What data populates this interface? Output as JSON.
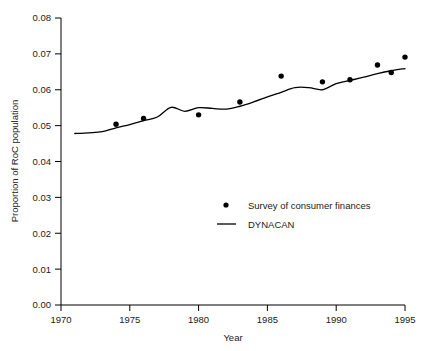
{
  "figure": {
    "clipped_header_text": "",
    "background_color": "#ffffff",
    "foreground_color": "#000000"
  },
  "axes": {
    "x_title": "Year",
    "y_title": "Proportion of RoC population",
    "x_tick_labels": [
      "1970",
      "1975",
      "1980",
      "1985",
      "1990",
      "1995"
    ],
    "y_tick_labels": [
      "0.00",
      "0.01",
      "0.02",
      "0.03",
      "0.04",
      "0.05",
      "0.06",
      "0.07",
      "0.08"
    ]
  },
  "legend": {
    "entries": [
      {
        "label": "Survey of consumer finances",
        "marker": "dot-marker",
        "color": "#000000"
      },
      {
        "label": "DYNACAN",
        "marker": "line-marker",
        "color": "#000000"
      }
    ]
  },
  "chart_data": {
    "type": "scatter",
    "title": "",
    "xlabel": "Year",
    "ylabel": "Proportion of RoC population",
    "xlim": [
      1970,
      1995
    ],
    "ylim": [
      0.0,
      0.08
    ],
    "xticks": [
      1970,
      1975,
      1980,
      1985,
      1990,
      1995
    ],
    "yticks": [
      0.0,
      0.01,
      0.02,
      0.03,
      0.04,
      0.05,
      0.06,
      0.07,
      0.08
    ],
    "grid": false,
    "legend_position": "center-right",
    "series": [
      {
        "name": "Survey of consumer finances",
        "type": "scatter",
        "marker": "circle",
        "color": "#000000",
        "x": [
          1974,
          1976,
          1980,
          1983,
          1986,
          1989,
          1991,
          1993,
          1994,
          1995
        ],
        "values": [
          0.0504,
          0.052,
          0.053,
          0.0566,
          0.0638,
          0.0622,
          0.0628,
          0.0669,
          0.0648,
          0.0691
        ]
      },
      {
        "name": "DYNACAN",
        "type": "line",
        "color": "#000000",
        "x": [
          1971,
          1972,
          1973,
          1974,
          1975,
          1976,
          1977,
          1978,
          1979,
          1980,
          1981,
          1982,
          1983,
          1984,
          1985,
          1986,
          1987,
          1988,
          1989,
          1990,
          1991,
          1992,
          1993,
          1994,
          1995
        ],
        "values": [
          0.0478,
          0.048,
          0.0483,
          0.0494,
          0.0503,
          0.0514,
          0.0524,
          0.0551,
          0.054,
          0.055,
          0.0548,
          0.0546,
          0.0554,
          0.0566,
          0.058,
          0.0593,
          0.0606,
          0.0606,
          0.06,
          0.0617,
          0.0626,
          0.0635,
          0.0645,
          0.0653,
          0.0659
        ]
      }
    ]
  }
}
